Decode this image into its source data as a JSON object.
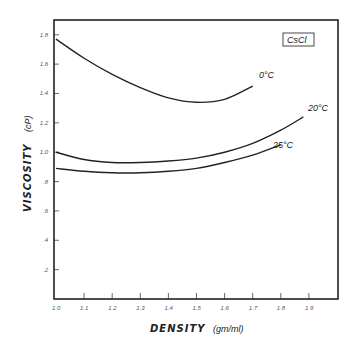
{
  "chart_data": {
    "type": "line",
    "title": "",
    "annotation_box": "CsCl",
    "xlabel": "DENSITY",
    "xlabel_unit": "(gm/ml)",
    "ylabel": "VISCOSITY",
    "ylabel_unit": "(cP)",
    "xlim": [
      1.0,
      2.0
    ],
    "ylim": [
      0,
      1.9
    ],
    "x_ticks": [
      "1.0",
      "1.1",
      "1.2",
      "1.3",
      "1.4",
      "1.5",
      "1.6",
      "1.7",
      "1.8",
      "1.9"
    ],
    "y_ticks": [
      ".2",
      ".4",
      ".6",
      ".8",
      "1.0",
      "1.2",
      "1.4",
      "1.6",
      "1.8"
    ],
    "grid": false,
    "legend": "inline curve labels",
    "series": [
      {
        "name": "0°C",
        "x": [
          1.0,
          1.1,
          1.2,
          1.3,
          1.4,
          1.5,
          1.6,
          1.7
        ],
        "y": [
          1.77,
          1.64,
          1.53,
          1.44,
          1.37,
          1.34,
          1.36,
          1.45
        ]
      },
      {
        "name": "20°C",
        "x": [
          1.0,
          1.1,
          1.2,
          1.3,
          1.4,
          1.5,
          1.6,
          1.7,
          1.8,
          1.88
        ],
        "y": [
          1.0,
          0.95,
          0.93,
          0.93,
          0.94,
          0.96,
          1.0,
          1.06,
          1.15,
          1.24
        ]
      },
      {
        "name": "25°C",
        "x": [
          1.0,
          1.1,
          1.2,
          1.3,
          1.4,
          1.5,
          1.6,
          1.7,
          1.8
        ],
        "y": [
          0.89,
          0.87,
          0.86,
          0.86,
          0.87,
          0.89,
          0.93,
          0.98,
          1.05
        ]
      }
    ]
  },
  "labels": {
    "box": "CsCl",
    "curve_0": "0°C",
    "curve_20": "20°C",
    "curve_25": "25°C",
    "x_title": "DENSITY",
    "x_unit": "(gm/ml)",
    "y_title": "VISCOSITY",
    "y_unit": "(cP)"
  }
}
